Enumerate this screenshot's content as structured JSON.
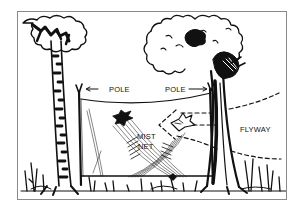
{
  "diagram": {
    "labels": {
      "pole_left": "POLE",
      "pole_right": "POLE",
      "net_line1": "MIST",
      "net_line2": "NET",
      "flyway": "FLYWAY"
    },
    "icons": [
      "left-tree",
      "right-tree",
      "left-pole",
      "right-pole",
      "mist-net",
      "caught-bird",
      "flying-bird",
      "flyway-dashed-lines",
      "grass"
    ],
    "colors": {
      "ink": "#111111",
      "paper": "#ffffff",
      "border": "#8a8a8a"
    }
  }
}
